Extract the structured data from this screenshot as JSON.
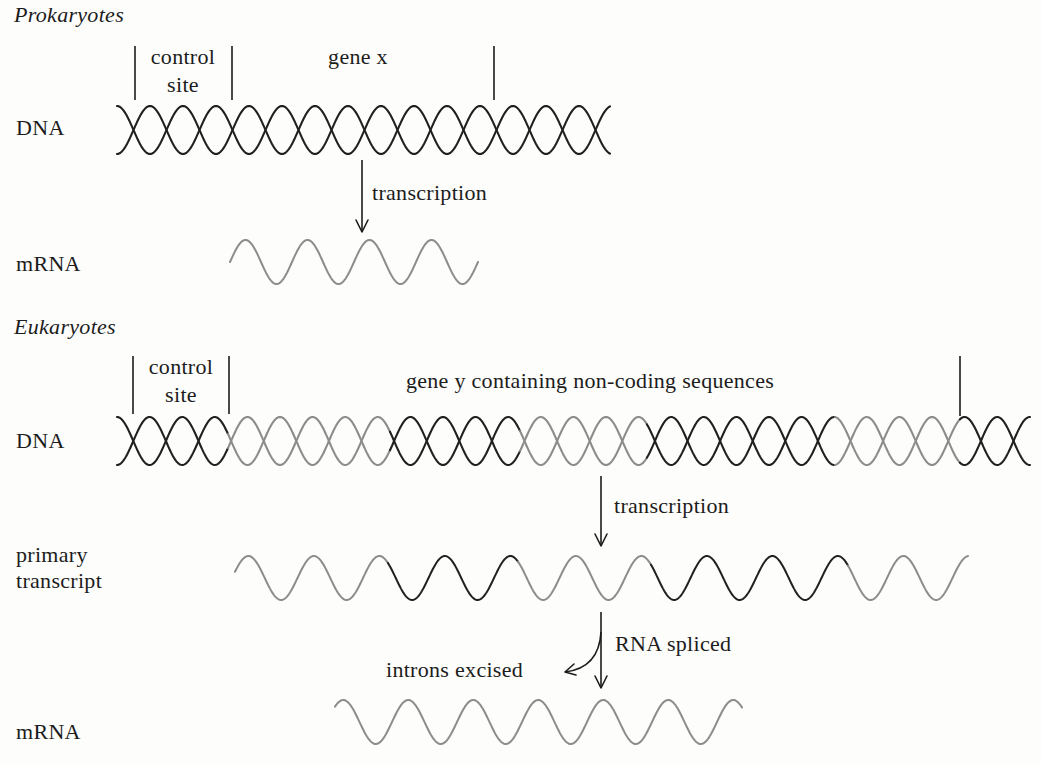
{
  "colors": {
    "background": "#fdfdfb",
    "text": "#1c1c1c",
    "dark_strand": "#202020",
    "light_strand": "#8c8c8c"
  },
  "prokaryotes": {
    "heading": "Prokaryotes",
    "dna_label": "DNA",
    "mrna_label": "mRNA",
    "control_site_line1": "control",
    "control_site_line2": "site",
    "gene_label": "gene x",
    "arrow_label": "transcription",
    "dna": {
      "x0": 117,
      "x1": 610,
      "cy": 130,
      "amp": 24,
      "half": 33,
      "segments": [
        {
          "from": 117,
          "to": 610,
          "tone": "dark"
        }
      ]
    },
    "markers": [
      {
        "x": 135,
        "y0": 46,
        "y1": 100
      },
      {
        "x": 232,
        "y0": 46,
        "y1": 100
      },
      {
        "x": 494,
        "y0": 46,
        "y1": 100
      }
    ],
    "arrow": {
      "x": 362,
      "y0": 160,
      "y1": 232
    },
    "mrna": {
      "x0": 230,
      "x1": 478,
      "cy": 262,
      "amp": 22,
      "wavelength": 62,
      "phase_x": 230,
      "segments": [
        {
          "from": 230,
          "to": 478,
          "tone": "light"
        }
      ]
    }
  },
  "eukaryotes": {
    "heading": "Eukaryotes",
    "dna_label": "DNA",
    "primary_label_line1": "primary",
    "primary_label_line2": "transcript",
    "mrna_label": "mRNA",
    "control_site_line1": "control",
    "control_site_line2": "site",
    "gene_label": "gene y containing non-coding sequences",
    "transcription_label": "transcription",
    "splice_label": "RNA spliced",
    "introns_label": "introns excised",
    "dna": {
      "x0": 117,
      "x1": 1030,
      "cy": 441,
      "amp": 24,
      "half": 32.6,
      "segments": [
        {
          "from": 117,
          "to": 228,
          "tone": "dark"
        },
        {
          "from": 228,
          "to": 390,
          "tone": "light"
        },
        {
          "from": 390,
          "to": 520,
          "tone": "dark"
        },
        {
          "from": 520,
          "to": 647,
          "tone": "light"
        },
        {
          "from": 647,
          "to": 835,
          "tone": "dark"
        },
        {
          "from": 835,
          "to": 960,
          "tone": "light"
        },
        {
          "from": 960,
          "to": 1030,
          "tone": "dark"
        }
      ]
    },
    "markers": [
      {
        "x": 133,
        "y0": 356,
        "y1": 414
      },
      {
        "x": 229,
        "y0": 356,
        "y1": 414
      },
      {
        "x": 960,
        "y0": 356,
        "y1": 416
      }
    ],
    "transcription_arrow": {
      "x": 601,
      "y0": 476,
      "y1": 546
    },
    "primary": {
      "x0": 235,
      "x1": 968,
      "cy": 578,
      "amp": 22,
      "wavelength": 65.5,
      "phase_x": 232,
      "segments": [
        {
          "from": 235,
          "to": 388,
          "tone": "light"
        },
        {
          "from": 388,
          "to": 518,
          "tone": "dark"
        },
        {
          "from": 518,
          "to": 651,
          "tone": "light"
        },
        {
          "from": 651,
          "to": 848,
          "tone": "dark"
        },
        {
          "from": 848,
          "to": 968,
          "tone": "light"
        }
      ]
    },
    "splice_arrow": {
      "x": 601,
      "y0": 612,
      "y1": 688,
      "branch_from_y": 632,
      "branch_to_x": 565,
      "branch_to_y": 672
    },
    "mrna": {
      "x0": 335,
      "x1": 742,
      "cy": 722,
      "amp": 22,
      "wavelength": 65,
      "phase_x": 327,
      "segments": [
        {
          "from": 335,
          "to": 742,
          "tone": "light"
        }
      ]
    }
  },
  "layout_labels": [
    {
      "key": "prokaryotes.heading",
      "x": 14,
      "y": 4,
      "italic": true
    },
    {
      "key": "prokaryotes.control_site_line1",
      "x": 183,
      "y": 46,
      "center": true
    },
    {
      "key": "prokaryotes.control_site_line2",
      "x": 183,
      "y": 74,
      "center": true
    },
    {
      "key": "prokaryotes.gene_label",
      "x": 358,
      "y": 46,
      "center": true
    },
    {
      "key": "prokaryotes.dna_label",
      "x": 16,
      "y": 117
    },
    {
      "key": "prokaryotes.arrow_label",
      "x": 372,
      "y": 182
    },
    {
      "key": "prokaryotes.mrna_label",
      "x": 16,
      "y": 253
    },
    {
      "key": "eukaryotes.heading",
      "x": 14,
      "y": 316,
      "italic": true
    },
    {
      "key": "eukaryotes.control_site_line1",
      "x": 181,
      "y": 356,
      "center": true
    },
    {
      "key": "eukaryotes.control_site_line2",
      "x": 181,
      "y": 384,
      "center": true
    },
    {
      "key": "eukaryotes.gene_label",
      "x": 590,
      "y": 370,
      "center": true
    },
    {
      "key": "eukaryotes.dna_label",
      "x": 16,
      "y": 430
    },
    {
      "key": "eukaryotes.transcription_label",
      "x": 614,
      "y": 495
    },
    {
      "key": "eukaryotes.primary_label_line1",
      "x": 16,
      "y": 544
    },
    {
      "key": "eukaryotes.primary_label_line2",
      "x": 16,
      "y": 570
    },
    {
      "key": "eukaryotes.splice_label",
      "x": 615,
      "y": 633
    },
    {
      "key": "eukaryotes.introns_label",
      "x": 386,
      "y": 659
    },
    {
      "key": "eukaryotes.mrna_label",
      "x": 16,
      "y": 721
    }
  ]
}
